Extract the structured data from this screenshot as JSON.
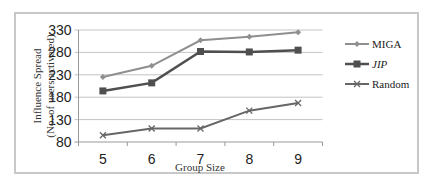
{
  "chart_data": {
    "type": "line",
    "title": "",
    "xlabel": "Group Size",
    "ylabel": "Influence Spread",
    "ylabel_sub": "(No. of users activated)",
    "x": [
      5,
      6,
      7,
      8,
      9
    ],
    "categories": [
      "5",
      "6",
      "7",
      "8",
      "9"
    ],
    "yticks": [
      "330",
      "280",
      "230",
      "180",
      "130",
      "80"
    ],
    "ylim": [
      80,
      330
    ],
    "grid": true,
    "legend_position": "right",
    "series": [
      {
        "name": "MIGA",
        "values": [
          225,
          250,
          307,
          315,
          325
        ],
        "marker": "diamond",
        "color": "#8f8f8f"
      },
      {
        "name": "JIP",
        "values": [
          194,
          212,
          282,
          281,
          285
        ],
        "marker": "square",
        "color": "#4f4f4f",
        "italic": true
      },
      {
        "name": "Random",
        "values": [
          95,
          110,
          110,
          150,
          167
        ],
        "marker": "x",
        "color": "#666666"
      }
    ]
  }
}
